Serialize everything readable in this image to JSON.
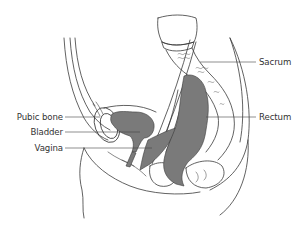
{
  "diagram": {
    "colors": {
      "outline": "#3a3a3a",
      "organ_fill": "#7a7a7a",
      "background": "#ffffff",
      "label_text": "#333333"
    },
    "labels": {
      "left": [
        {
          "text": "Pubic bone",
          "y": 116
        },
        {
          "text": "Bladder",
          "y": 132
        },
        {
          "text": "Vagina",
          "y": 147
        }
      ],
      "right": [
        {
          "text": "Sacrum",
          "y": 62
        },
        {
          "text": "Rectum",
          "y": 117
        }
      ]
    }
  }
}
